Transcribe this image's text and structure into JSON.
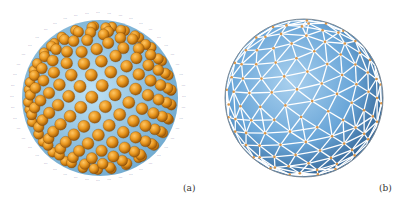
{
  "figure": {
    "panels": [
      {
        "id": "a",
        "label": "(a)",
        "description": "Sphere packed with orange spheres (particles) with blue numeric index labels around the rim",
        "colors": {
          "sphere": "#e8961e",
          "sphere_shadow": "#a85f0a",
          "core": "#8ec5e6",
          "label": "#4a4f8c"
        }
      },
      {
        "id": "b",
        "label": "(b)",
        "description": "Triangulated spherical mesh with blue faces, white edges and orange vertices",
        "colors": {
          "face": "#6aa6d8",
          "face_dark": "#3b77b0",
          "edge": "#ffffff",
          "vertex": "#d9964a"
        }
      }
    ]
  }
}
